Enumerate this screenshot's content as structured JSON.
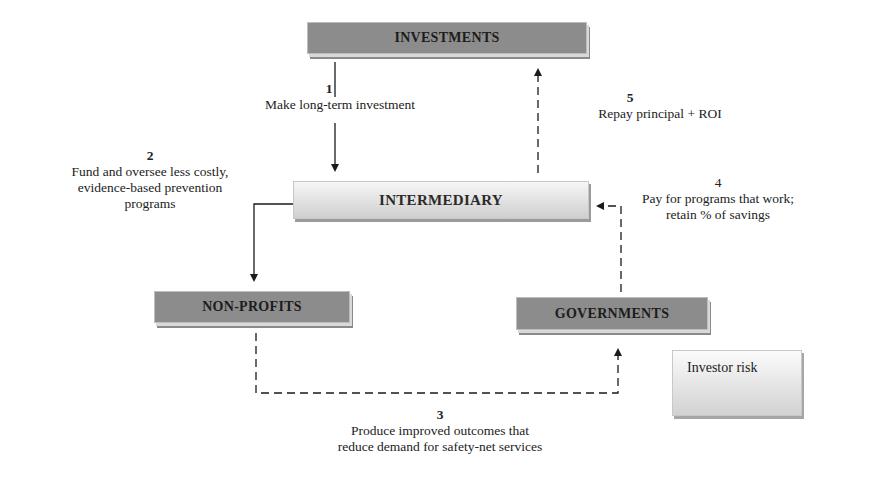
{
  "diagram": {
    "nodes": {
      "investments": "INVESTMENTS",
      "intermediary": "INTERMEDIARY",
      "non_profits": "NON-PROFITS",
      "governments": "GOVERNMENTS"
    },
    "steps": [
      {
        "number": "1",
        "text": "Make long-term investment"
      },
      {
        "number": "2",
        "text_lines": [
          "Fund and oversee less costly,",
          "evidence-based prevention",
          "programs"
        ]
      },
      {
        "number": "3",
        "text_lines": [
          "Produce improved outcomes that",
          "reduce demand for safety-net services"
        ]
      },
      {
        "number": "4",
        "text_lines": [
          "Pay for programs that work;",
          "retain % of savings"
        ]
      },
      {
        "number": "5",
        "text": "Repay principal + ROI"
      }
    ],
    "legend": {
      "label": "Investor risk",
      "symbol": "dashed-arrow"
    },
    "colors": {
      "dark_box": "#8c8c8c",
      "light_box": "#e6e6e6",
      "line": "#1a1a1a"
    }
  }
}
